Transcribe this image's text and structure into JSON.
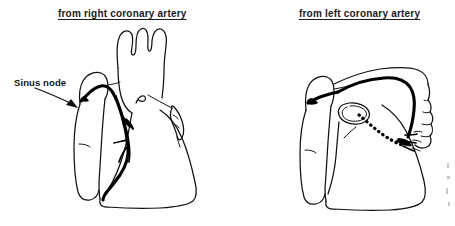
{
  "figure": {
    "kind": "anatomical-line-drawing",
    "background_color": "#ffffff",
    "line_color": "#111111",
    "vessel_color": "#000000",
    "panels": [
      {
        "id": "right-coronary",
        "title": "from right coronary artery",
        "title_underlined": true,
        "annotations": [
          {
            "id": "sinus-node",
            "label": "Sinus node",
            "pointer": "arrow-down-right"
          }
        ],
        "features": [
          "aortic arch with three brachiocephalic branches",
          "right atrium",
          "right ventricle",
          "left atrial appendage",
          "right coronary artery with sinus node branch"
        ]
      },
      {
        "id": "left-coronary",
        "title": "from left coronary artery",
        "title_underlined": true,
        "annotations": [],
        "features": [
          "left atrium",
          "left ventricle",
          "aortic root ring",
          "left coronary artery with dotted posterior course",
          "sinus node branch crossing to right atrium"
        ]
      }
    ]
  }
}
